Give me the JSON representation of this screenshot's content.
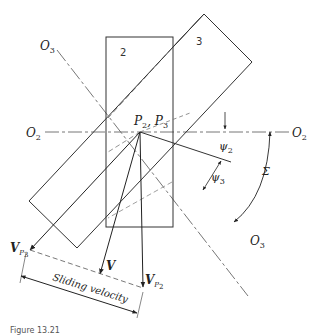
{
  "diagram": {
    "type": "crossed-helical-gears-velocity",
    "labels": {
      "gear2": "2",
      "gear3": "3",
      "axis_o3_top": "O",
      "axis_o3_top_sub": "3",
      "axis_o3_bottom": "O",
      "axis_o3_bottom_sub": "3",
      "axis_o2_left": "O",
      "axis_o2_left_sub": "2",
      "axis_o2_right": "O",
      "axis_o2_right_sub": "2",
      "pitch_point": "P",
      "pitch_point_sub1": "2",
      "pitch_point_sep": ", P",
      "pitch_point_sub2": "3",
      "psi2": "ψ",
      "psi2_sub": "2",
      "psi3": "ψ",
      "psi3_sub": "3",
      "sigma": "Σ",
      "vp3": "V",
      "vp3_sub": "P",
      "vp3_subsub": "3",
      "v": "V",
      "vp2": "V",
      "vp2_sub": "P",
      "vp2_subsub": "2",
      "sliding_velocity": "Sliding velocity",
      "caption": "Figure 13.21"
    },
    "colors": {
      "line": "#333333",
      "centerline": "#666666",
      "background": "#ffffff"
    }
  }
}
